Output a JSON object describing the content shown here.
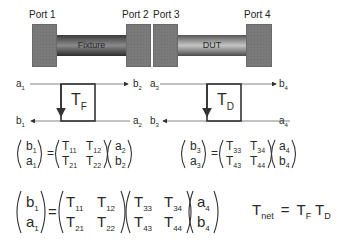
{
  "ports": [
    {
      "label": "Port 1"
    },
    {
      "label": "Port 2"
    },
    {
      "label": "Port 3"
    },
    {
      "label": "Port 4"
    }
  ],
  "cables": {
    "fixture": "Fixture",
    "dut": "DUT"
  },
  "flow_graph_left": {
    "in_top": "a",
    "in_top_sub": "1",
    "out_top": "b",
    "out_top_sub": "2",
    "out_bottom": "b",
    "out_bottom_sub": "1",
    "in_bottom": "a",
    "in_bottom_sub": "2",
    "box": "T",
    "box_sub": "F"
  },
  "flow_graph_right": {
    "in_top": "a",
    "in_top_sub": "3",
    "out_top": "b",
    "out_top_sub": "4",
    "out_bottom": "b",
    "out_bottom_sub": "3",
    "in_bottom": "a",
    "in_bottom_sub": "4",
    "box": "T",
    "box_sub": "D"
  },
  "equation_fixture": {
    "lhs": [
      [
        "b",
        "1"
      ],
      [
        "a",
        "1"
      ]
    ],
    "matrix": [
      [
        [
          "T",
          "11"
        ],
        [
          "T",
          "12"
        ]
      ],
      [
        [
          "T",
          "21"
        ],
        [
          "T",
          "22"
        ]
      ]
    ],
    "rhs": [
      [
        "a",
        "2"
      ],
      [
        "b",
        "2"
      ]
    ]
  },
  "equation_dut": {
    "lhs": [
      [
        "b",
        "3"
      ],
      [
        "a",
        "3"
      ]
    ],
    "matrix": [
      [
        [
          "T",
          "33"
        ],
        [
          "T",
          "34"
        ]
      ],
      [
        [
          "T",
          "43"
        ],
        [
          "T",
          "44"
        ]
      ]
    ],
    "rhs": [
      [
        "a",
        "4"
      ],
      [
        "b",
        "4"
      ]
    ]
  },
  "equation_cascade": {
    "lhs": [
      [
        "b",
        "1"
      ],
      [
        "a",
        "1"
      ]
    ],
    "matrix1": [
      [
        [
          "T",
          "11"
        ],
        [
          "T",
          "12"
        ]
      ],
      [
        [
          "T",
          "21"
        ],
        [
          "T",
          "22"
        ]
      ]
    ],
    "matrix2": [
      [
        [
          "T",
          "33"
        ],
        [
          "T",
          "34"
        ]
      ],
      [
        [
          "T",
          "43"
        ],
        [
          "T",
          "44"
        ]
      ]
    ],
    "rhs": [
      [
        "a",
        "4"
      ],
      [
        "b",
        "4"
      ]
    ]
  },
  "net_equation": {
    "lhs": "T",
    "lhs_sub": "net",
    "equals": "=",
    "f1": "T",
    "f1_sub": "F",
    "f2": "T",
    "f2_sub": "D"
  },
  "equals_sign": "="
}
